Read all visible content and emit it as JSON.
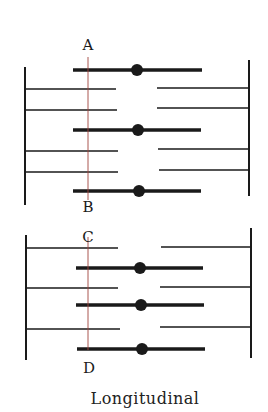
{
  "diagram": {
    "caption": "Longitudinal",
    "colors": {
      "lines": "#1a1a1a",
      "section_line": "#a0443c",
      "background": "#ffffff"
    },
    "sections": [
      {
        "name": "top-sarcomere",
        "z_lines": [
          {
            "side": "left",
            "x": 25,
            "y1": 67,
            "y2": 205
          },
          {
            "side": "right",
            "x": 249,
            "y1": 60,
            "y2": 196
          }
        ],
        "thin_filaments_left": [
          {
            "x1": 25,
            "x2": 116,
            "y": 89
          },
          {
            "x1": 25,
            "x2": 117,
            "y": 110
          },
          {
            "x1": 25,
            "x2": 118,
            "y": 151
          },
          {
            "x1": 25,
            "x2": 118,
            "y": 172
          }
        ],
        "thin_filaments_right": [
          {
            "x1": 157,
            "x2": 249,
            "y": 88
          },
          {
            "x1": 157,
            "x2": 249,
            "y": 108
          },
          {
            "x1": 158,
            "x2": 250,
            "y": 149
          },
          {
            "x1": 159,
            "x2": 250,
            "y": 170
          }
        ],
        "thick_filaments": [
          {
            "x1": 73,
            "x2": 202,
            "y": 70,
            "dot_x": 137
          },
          {
            "x1": 73,
            "x2": 201,
            "y": 130,
            "dot_x": 138
          },
          {
            "x1": 73,
            "x2": 201,
            "y": 191,
            "dot_x": 139
          }
        ],
        "section_line": {
          "x": 88,
          "y1": 57,
          "y2": 200
        },
        "labels": [
          {
            "text": "A",
            "x": 88,
            "y": 50
          },
          {
            "text": "B",
            "x": 88,
            "y": 212
          }
        ]
      },
      {
        "name": "bottom-sarcomere",
        "z_lines": [
          {
            "side": "left",
            "x": 26,
            "y1": 235,
            "y2": 360
          },
          {
            "side": "right",
            "x": 251,
            "y1": 228,
            "y2": 358
          }
        ],
        "thin_filaments_left": [
          {
            "x1": 26,
            "x2": 118,
            "y": 248
          },
          {
            "x1": 26,
            "x2": 118,
            "y": 288
          },
          {
            "x1": 27,
            "x2": 120,
            "y": 329
          }
        ],
        "thin_filaments_right": [
          {
            "x1": 161,
            "x2": 251,
            "y": 247
          },
          {
            "x1": 160,
            "x2": 251,
            "y": 287
          },
          {
            "x1": 160,
            "x2": 251,
            "y": 327
          }
        ],
        "thick_filaments": [
          {
            "x1": 76,
            "x2": 203,
            "y": 268,
            "dot_x": 140
          },
          {
            "x1": 76,
            "x2": 204,
            "y": 305,
            "dot_x": 141
          },
          {
            "x1": 77,
            "x2": 205,
            "y": 349,
            "dot_x": 142
          }
        ],
        "section_line": {
          "x": 88,
          "y1": 237,
          "y2": 350
        },
        "labels": [
          {
            "text": "C",
            "x": 88,
            "y": 242
          },
          {
            "text": "D",
            "x": 89,
            "y": 373
          }
        ]
      }
    ]
  }
}
